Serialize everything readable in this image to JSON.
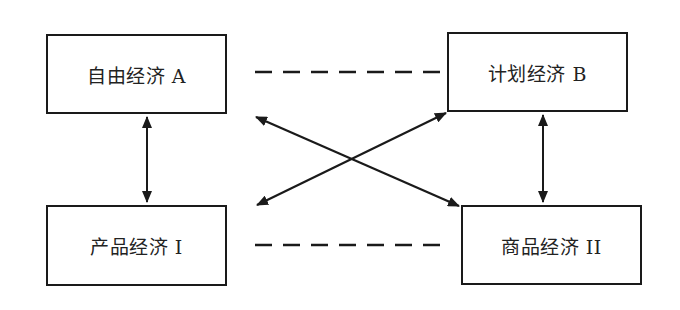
{
  "diagram": {
    "type": "concept-relationship",
    "nodes": [
      {
        "id": "A",
        "label": "自由经济 A",
        "x": 46,
        "y": 34,
        "w": 181,
        "h": 80
      },
      {
        "id": "B",
        "label": "计划经济 B",
        "x": 447,
        "y": 32,
        "w": 181,
        "h": 80
      },
      {
        "id": "I",
        "label": "产品经济 I",
        "x": 46,
        "y": 205,
        "w": 181,
        "h": 81
      },
      {
        "id": "II",
        "label": "商品经济 II",
        "x": 461,
        "y": 205,
        "w": 181,
        "h": 80
      }
    ],
    "edges": [
      {
        "from": "A",
        "to": "B",
        "style": "dashed",
        "arrows": "none"
      },
      {
        "from": "I",
        "to": "II",
        "style": "dashed",
        "arrows": "none"
      },
      {
        "from": "A",
        "to": "I",
        "style": "solid",
        "arrows": "both"
      },
      {
        "from": "B",
        "to": "II",
        "style": "solid",
        "arrows": "both"
      },
      {
        "from": "A",
        "to": "II",
        "style": "solid",
        "arrows": "both"
      },
      {
        "from": "B",
        "to": "I",
        "style": "solid",
        "arrows": "both"
      }
    ],
    "colors": {
      "stroke": "#1a1a1a",
      "text": "#222222",
      "background": "#ffffff"
    }
  }
}
